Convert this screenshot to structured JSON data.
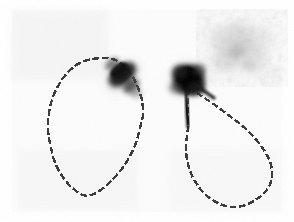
{
  "viewport": {
    "width": 294,
    "height": 222,
    "background_color": "#ffffff",
    "field_background_color": "#fbfbfb",
    "field_origin_x": 12,
    "field_origin_y": 10,
    "field_width": 270,
    "field_height": 202
  },
  "image": {
    "modality_label": "scintigram",
    "colormap": "grayscale-inverted",
    "contour_color": "#3a3a3a",
    "hotspot_color": "#1a1a1a",
    "scatter_color": "#c8c8c8"
  },
  "chart_data": {
    "type": "heatmap",
    "title": "",
    "xlabel": "",
    "ylabel": "",
    "grid": false,
    "legend": "none",
    "xlim": [
      12,
      282
    ],
    "ylim": [
      10,
      212
    ],
    "regions_of_interest": [
      {
        "name": "roi-left",
        "label": "left-region",
        "shape": "closed-polygon",
        "orientation_deg": 5,
        "center_x": 96,
        "center_y": 128,
        "width": 97,
        "height": 140,
        "bbox": [
          48,
          58,
          145,
          198
        ],
        "stroke": "#3a3a3a",
        "stroke_style": "pixelated-dashed",
        "stroke_width": 2.4,
        "points": [
          [
            92,
            59
          ],
          [
            100,
            58
          ],
          [
            108,
            58
          ],
          [
            116,
            60
          ],
          [
            122,
            64
          ],
          [
            128,
            70
          ],
          [
            133,
            77
          ],
          [
            137,
            85
          ],
          [
            140,
            93
          ],
          [
            142,
            100
          ],
          [
            143,
            108
          ],
          [
            143,
            116
          ],
          [
            141,
            124
          ],
          [
            139,
            132
          ],
          [
            137,
            140
          ],
          [
            134,
            148
          ],
          [
            130,
            156
          ],
          [
            126,
            163
          ],
          [
            121,
            170
          ],
          [
            115,
            177
          ],
          [
            108,
            184
          ],
          [
            101,
            190
          ],
          [
            94,
            194
          ],
          [
            88,
            196
          ],
          [
            82,
            195
          ],
          [
            76,
            191
          ],
          [
            70,
            186
          ],
          [
            65,
            180
          ],
          [
            60,
            173
          ],
          [
            56,
            165
          ],
          [
            53,
            157
          ],
          [
            51,
            148
          ],
          [
            49,
            139
          ],
          [
            48,
            130
          ],
          [
            48,
            121
          ],
          [
            49,
            112
          ],
          [
            51,
            103
          ],
          [
            54,
            94
          ],
          [
            58,
            86
          ],
          [
            63,
            78
          ],
          [
            69,
            71
          ],
          [
            76,
            65
          ],
          [
            84,
            61
          ]
        ]
      },
      {
        "name": "roi-right",
        "label": "right-region",
        "shape": "closed-polygon",
        "orientation_deg": -40,
        "center_x": 222,
        "center_y": 150,
        "width": 110,
        "height": 120,
        "bbox": [
          186,
          85,
          278,
          208
        ],
        "stroke": "#3a3a3a",
        "stroke_style": "pixelated-dashed",
        "stroke_width": 2.4,
        "points": [
          [
            189,
            88
          ],
          [
            197,
            93
          ],
          [
            206,
            99
          ],
          [
            215,
            105
          ],
          [
            223,
            111
          ],
          [
            231,
            117
          ],
          [
            239,
            123
          ],
          [
            246,
            129
          ],
          [
            253,
            136
          ],
          [
            259,
            143
          ],
          [
            264,
            150
          ],
          [
            268,
            157
          ],
          [
            271,
            164
          ],
          [
            272,
            171
          ],
          [
            272,
            178
          ],
          [
            270,
            185
          ],
          [
            266,
            191
          ],
          [
            261,
            196
          ],
          [
            254,
            201
          ],
          [
            246,
            205
          ],
          [
            238,
            207
          ],
          [
            230,
            207
          ],
          [
            222,
            205
          ],
          [
            214,
            201
          ],
          [
            207,
            196
          ],
          [
            201,
            190
          ],
          [
            196,
            183
          ],
          [
            192,
            176
          ],
          [
            189,
            168
          ],
          [
            187,
            160
          ],
          [
            186,
            152
          ],
          [
            186,
            144
          ],
          [
            187,
            136
          ],
          [
            188,
            128
          ],
          [
            188,
            120
          ],
          [
            188,
            112
          ],
          [
            188,
            104
          ],
          [
            188,
            96
          ]
        ]
      }
    ],
    "hotspots": [
      {
        "name": "hotspot-left",
        "label": "left-uptake-focus",
        "center_x": 123,
        "center_y": 76,
        "radius_x": 22,
        "radius_y": 15,
        "rotation_deg": -38,
        "peak_intensity": 0.88,
        "shape": "elongated-oblique"
      },
      {
        "name": "hotspot-right",
        "label": "right-uptake-focus",
        "center_x": 189,
        "center_y": 80,
        "radius_x": 21,
        "radius_y": 20,
        "rotation_deg": -15,
        "peak_intensity": 0.96,
        "shape": "round-dense"
      }
    ],
    "stem": {
      "name": "stem-right",
      "label": "descending-tracer-trail",
      "x1": 186,
      "y1": 92,
      "x2": 188,
      "y2": 127,
      "intensity": 0.85
    },
    "scatter_field": {
      "name": "background-scatter",
      "label": "diffuse-scatter",
      "center_x": 240,
      "center_y": 48,
      "width": 76,
      "height": 62,
      "mean_intensity": 0.18,
      "texture": "mottled"
    }
  }
}
